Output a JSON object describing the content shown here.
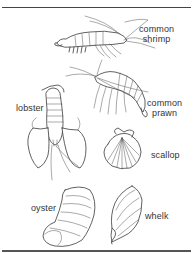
{
  "figure": {
    "title": "",
    "style": {
      "line_color": "#3a3a3a",
      "background": "#ffffff",
      "text_color": "#333333"
    },
    "labels": {
      "shrimp": {
        "line1": "common",
        "line2": "shrimp"
      },
      "prawn": {
        "line1": "common",
        "line2": "prawn"
      },
      "lobster": {
        "text": "lobster"
      },
      "scallop": {
        "text": "scallop"
      },
      "oyster": {
        "text": "oyster"
      },
      "whelk": {
        "text": "whelk"
      }
    },
    "items": [
      {
        "name": "common shrimp",
        "icon": "shrimp-illustration"
      },
      {
        "name": "common prawn",
        "icon": "prawn-illustration"
      },
      {
        "name": "lobster",
        "icon": "lobster-illustration"
      },
      {
        "name": "scallop",
        "icon": "scallop-illustration"
      },
      {
        "name": "oyster",
        "icon": "oyster-illustration"
      },
      {
        "name": "whelk",
        "icon": "whelk-illustration"
      }
    ]
  }
}
